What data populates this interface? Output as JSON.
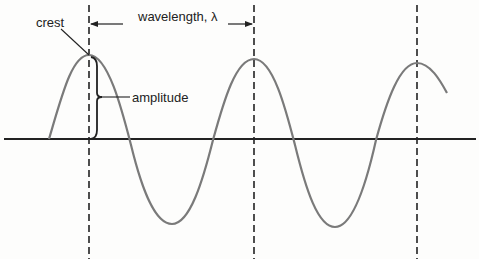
{
  "labels": {
    "crest": "crest",
    "wavelength": "wavelength, λ",
    "amplitude": "amplitude"
  },
  "colors": {
    "wave": "#7a7a7a",
    "axis": "#222222",
    "dashed": "#222222",
    "text": "#222222"
  },
  "geometry": {
    "axis_y": 139,
    "dashed_x": [
      89,
      254,
      417
    ],
    "crest_y": 55,
    "trough_y": 225
  }
}
